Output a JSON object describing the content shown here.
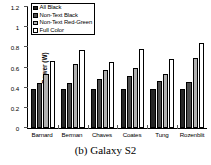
{
  "caption": "(b) Galaxy S2",
  "chart_data": {
    "type": "bar",
    "title": "",
    "subtitle": "",
    "xlabel": "",
    "ylabel": "Power (W)",
    "ylim": [
      0,
      1.2
    ],
    "yticks": [
      "0",
      "0.2",
      "0.4",
      "0.6",
      "0.8",
      "1",
      "1.2"
    ],
    "ytick_values": [
      0,
      0.2,
      0.4,
      0.6,
      0.8,
      1,
      1.2
    ],
    "grid": false,
    "legend_position": "top-left",
    "categories": [
      "Barnard",
      "Berman",
      "Chaves",
      "Coates",
      "Tung",
      "Rozenblit"
    ],
    "series": [
      {
        "name": "All Black",
        "color": "#262626",
        "values": [
          0.39,
          0.39,
          0.39,
          0.39,
          0.39,
          0.39
        ]
      },
      {
        "name": "Non-Text Black",
        "color": "#4d4d4d",
        "values": [
          0.45,
          0.45,
          0.49,
          0.52,
          0.47,
          0.46
        ]
      },
      {
        "name": "Non-Text Red-Green",
        "color": "#b0b0b0",
        "values": [
          0.54,
          0.63,
          0.58,
          0.6,
          0.54,
          0.69
        ]
      },
      {
        "name": "Full Color",
        "color": "#ffffff",
        "values": [
          0.66,
          0.77,
          0.65,
          0.78,
          0.68,
          0.84
        ]
      }
    ]
  }
}
